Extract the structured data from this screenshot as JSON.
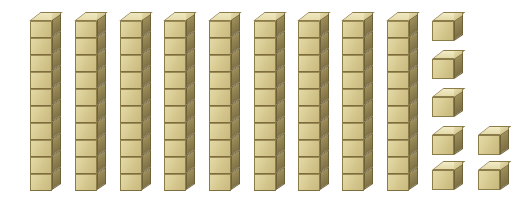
{
  "illustration": {
    "title": "Base ten blocks",
    "subject": "place-value-manipulatives",
    "background_color": "#ffffff",
    "represented_number": "97"
  },
  "colors": {
    "front_face": "#ddd19a",
    "right_face": "#8b7d4e",
    "top_face": "#e8dfb0",
    "outline": "#8c7c4a",
    "background": "#ffffff"
  },
  "blocks": {
    "rods": {
      "label": "tens rod",
      "count": 9,
      "units_per_rod": 10,
      "total_value": "90",
      "segment_width": 22,
      "segment_height": 17,
      "depth": 9,
      "top_y": 12,
      "positions_x": [
        30,
        75,
        120,
        164,
        209,
        254,
        298,
        342,
        387
      ]
    },
    "cubes": {
      "label": "unit cube",
      "count": 7,
      "total_value": "7",
      "size": 22,
      "depth": 9,
      "positions": [
        {
          "x": 432,
          "y": 12
        },
        {
          "x": 432,
          "y": 50
        },
        {
          "x": 432,
          "y": 88
        },
        {
          "x": 432,
          "y": 126
        },
        {
          "x": 432,
          "y": 161
        },
        {
          "x": 478,
          "y": 126
        },
        {
          "x": 478,
          "y": 161
        }
      ]
    }
  },
  "chart_data": {
    "type": "bar",
    "title": "Base ten blocks",
    "categories": [
      "tens rods",
      "unit cubes"
    ],
    "values": [
      9,
      7
    ],
    "xlabel": "",
    "ylabel": "count",
    "ylim": [
      0,
      10
    ],
    "annotations": [
      "9 tens = 90",
      "7 ones = 7",
      "total = 97"
    ]
  }
}
